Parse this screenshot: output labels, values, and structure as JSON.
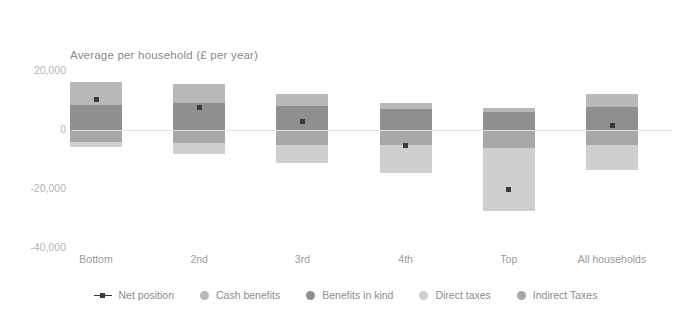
{
  "chart_data": {
    "type": "bar",
    "title": "Average per household (£ per year)",
    "xlabel": "",
    "ylabel": "",
    "ylim": [
      -40000,
      20000
    ],
    "yticks": [
      20000,
      0,
      -20000,
      -40000
    ],
    "ytick_labels": [
      "20,000",
      "0",
      "-20,000",
      "-40,000"
    ],
    "grid": false,
    "legend_position": "bottom",
    "categories": [
      "Bottom",
      "2nd",
      "3rd",
      "4th",
      "Top",
      "All households"
    ],
    "series": [
      {
        "name": "Cash benefits",
        "color": "#b9b9b9",
        "values": [
          7800,
          6600,
          4100,
          2300,
          1300,
          4400
        ]
      },
      {
        "name": "Benefits in kind",
        "color": "#8f8f8f",
        "values": [
          8500,
          9000,
          8000,
          7000,
          6000,
          7700
        ]
      },
      {
        "name": "Direct taxes",
        "color": "#cfcfcf",
        "values": [
          -1800,
          -3500,
          -6200,
          -9400,
          -21500,
          -8500
        ]
      },
      {
        "name": "Indirect taxes",
        "color": "#a8a8a8",
        "values": [
          -4000,
          -4500,
          -5000,
          -5200,
          -6000,
          -5000
        ]
      }
    ],
    "net_position": {
      "name": "Net position",
      "color": "#3a3a3a",
      "values": [
        10500,
        7600,
        2900,
        -5300,
        -20200,
        1400
      ]
    }
  },
  "legend": {
    "items": [
      {
        "label": "Net position",
        "marker": "line-dot",
        "color": "#3a3a3a"
      },
      {
        "label": "Cash benefits",
        "marker": "dot",
        "color": "#b9b9b9"
      },
      {
        "label": "Benefits in kind",
        "marker": "dot",
        "color": "#8f8f8f"
      },
      {
        "label": "Direct taxes",
        "marker": "dot",
        "color": "#cfcfcf"
      },
      {
        "label": "Indirect Taxes",
        "marker": "dot",
        "color": "#a8a8a8"
      }
    ]
  }
}
